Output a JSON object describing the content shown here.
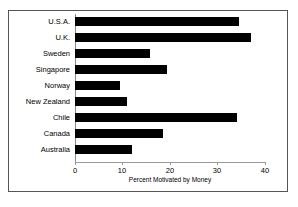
{
  "chart_data": {
    "type": "bar",
    "orientation": "horizontal",
    "title": "",
    "xlabel": "Percent Motivated by Money",
    "ylabel": "",
    "categories": [
      "U.S.A.",
      "U.K.",
      "Sweden",
      "Singapore",
      "Norway",
      "New Zealand",
      "Chile",
      "Canada",
      "Australia"
    ],
    "values": [
      34.5,
      37,
      15.8,
      19.4,
      9.5,
      11,
      34,
      18.5,
      12
    ],
    "xlim": [
      0,
      40
    ],
    "xticks": [
      0,
      10,
      20,
      30,
      40
    ],
    "xtick_labels": [
      "0",
      "10",
      "20",
      "30",
      "40"
    ],
    "grid": false,
    "legend": false,
    "bar_color": "#000000",
    "background_color": "#ffffff",
    "frame_color": "#555555",
    "axis_color": "#9a9a9a"
  }
}
